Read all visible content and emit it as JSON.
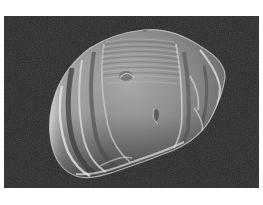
{
  "image": {
    "kind": "scanning electron micrograph",
    "subject": "pollen grain / seed with ridged, wrinkled surface",
    "background_color": "#2b2b2b",
    "frame_color": "#ffffff",
    "subject_highlight_color": "#e6e6e6",
    "subject_midtone_color": "#8a8a8a",
    "subject_shadow_color": "#3a3a3a"
  },
  "caption": ""
}
